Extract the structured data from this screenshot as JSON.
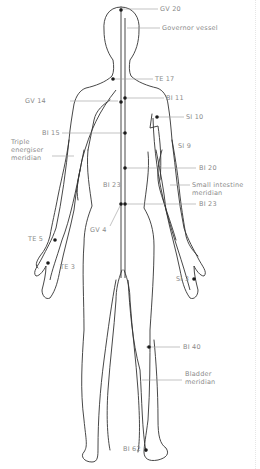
{
  "diagram": {
    "colors": {
      "outline": "#333333",
      "point": "#1a1a1a",
      "leader": "#9a9a9a",
      "label": "#8a8a8a"
    },
    "labels": {
      "gv20": "GV 20",
      "governor_vessel": "Governor vessel",
      "te17": "TE 17",
      "gv14": "GV 14",
      "bl11": "BI 11",
      "si10": "SI 10",
      "bl15": "BI 15",
      "triple_energiser_1": "Triple",
      "triple_energiser_2": "energiser",
      "triple_energiser_3": "meridian",
      "si9": "SI 9",
      "bl20": "BI 20",
      "small_intestine_1": "Small intestine",
      "small_intestine_2": "meridian",
      "bl23_right": "BI 23",
      "bl23_left": "BI 23",
      "gv4": "GV 4",
      "te5": "TE 5",
      "te3": "TE 3",
      "si3": "SI 3",
      "bl40": "BI 40",
      "bladder_1": "Bladder",
      "bladder_2": "meridian",
      "bl62": "BI 62"
    }
  }
}
